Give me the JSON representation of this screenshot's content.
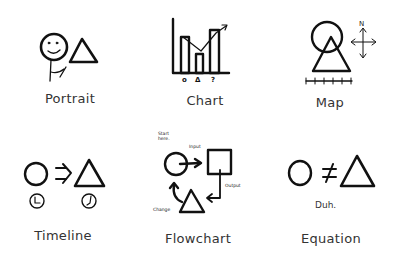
{
  "figure": {
    "items": [
      {
        "id": "portrait",
        "label": "Portrait",
        "description": "Stick figure with smiling face holding a triangle"
      },
      {
        "id": "chart",
        "label": "Chart",
        "description": "Bar chart with trend arrow",
        "axis_labels": [
          "o",
          "Δ",
          "?"
        ]
      },
      {
        "id": "map",
        "label": "Map",
        "description": "Circle and triangle overlapping with compass and scale bar",
        "compass_label": "N"
      },
      {
        "id": "timeline",
        "label": "Timeline",
        "description": "Circle arrows to triangle with clocks below"
      },
      {
        "id": "flowchart",
        "label": "Flowchart",
        "description": "Circle to square to triangle loop",
        "annotations": {
          "start": "Start here.",
          "input": "Input",
          "output": "Output",
          "change": "Change"
        }
      },
      {
        "id": "equation",
        "label": "Equation",
        "description": "Circle not equal to triangle",
        "caption": "Duh."
      }
    ]
  },
  "colors": {
    "stroke": "#111111",
    "label": "#333333",
    "background": "#ffffff"
  }
}
